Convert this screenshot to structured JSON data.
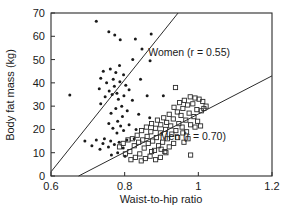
{
  "chart_data": {
    "type": "scatter",
    "title": "",
    "xlabel": "Waist-to-hip ratio",
    "ylabel": "Body fat mass (kg)",
    "xlim": [
      0.6,
      1.2
    ],
    "ylim": [
      0,
      70
    ],
    "xticks": [
      0.6,
      0.8,
      1,
      1.2
    ],
    "xtick_labels": [
      "0.6",
      "0.8",
      "1",
      "1.2"
    ],
    "yticks": [
      0,
      10,
      20,
      30,
      40,
      50,
      60,
      70
    ],
    "ytick_labels": [
      "0",
      "10",
      "20",
      "30",
      "40",
      "50",
      "60",
      "70"
    ],
    "grid": false,
    "legend_position": "inline-annotations",
    "series": [
      {
        "name": "Women",
        "marker": "filled-circle",
        "annotation": "Women (r = 0.55)",
        "r": 0.55,
        "annotation_x": 0.975,
        "annotation_y": 51.5,
        "fit_line": {
          "x": [
            0.6,
            0.945
          ],
          "y": [
            1.8,
            70.0
          ]
        },
        "points": [
          [
            0.651,
            34.8
          ],
          [
            0.723,
            66.5
          ],
          [
            0.757,
            62.0
          ],
          [
            0.773,
            60.5
          ],
          [
            0.788,
            58.5
          ],
          [
            0.829,
            58.8
          ],
          [
            0.872,
            61.0
          ],
          [
            0.847,
            54.5
          ],
          [
            0.822,
            50.0
          ],
          [
            0.869,
            49.5
          ],
          [
            0.786,
            47.5
          ],
          [
            0.761,
            46.0
          ],
          [
            0.742,
            45.0
          ],
          [
            0.776,
            44.5
          ],
          [
            0.797,
            43.5
          ],
          [
            0.735,
            42.0
          ],
          [
            0.769,
            41.5
          ],
          [
            0.787,
            40.5
          ],
          [
            0.751,
            40.0
          ],
          [
            0.803,
            39.0
          ],
          [
            0.772,
            38.5
          ],
          [
            0.731,
            37.5
          ],
          [
            0.812,
            37.0
          ],
          [
            0.843,
            41.5
          ],
          [
            0.758,
            36.5
          ],
          [
            0.779,
            35.5
          ],
          [
            0.766,
            35.0
          ],
          [
            0.798,
            34.5
          ],
          [
            0.861,
            34.5
          ],
          [
            0.905,
            34.5
          ],
          [
            0.747,
            34.0
          ],
          [
            0.783,
            33.0
          ],
          [
            0.821,
            32.5
          ],
          [
            0.735,
            31.0
          ],
          [
            0.792,
            30.0
          ],
          [
            0.776,
            29.0
          ],
          [
            0.807,
            28.0
          ],
          [
            0.763,
            27.0
          ],
          [
            0.838,
            26.5
          ],
          [
            0.794,
            25.5
          ],
          [
            0.868,
            25.0
          ],
          [
            0.781,
            23.5
          ],
          [
            0.757,
            22.5
          ],
          [
            0.812,
            22.0
          ],
          [
            0.789,
            21.5
          ],
          [
            0.768,
            20.5
          ],
          [
            0.831,
            20.0
          ],
          [
            0.797,
            19.5
          ],
          [
            0.779,
            18.5
          ],
          [
            0.745,
            16.0
          ],
          [
            0.723,
            15.5
          ],
          [
            0.692,
            15.0
          ],
          [
            0.762,
            15.0
          ],
          [
            0.806,
            15.5
          ],
          [
            0.826,
            16.0
          ],
          [
            0.785,
            14.5
          ],
          [
            0.741,
            14.0
          ],
          [
            0.772,
            13.5
          ],
          [
            0.711,
            13.0
          ],
          [
            0.756,
            12.5
          ],
          [
            0.796,
            12.0
          ],
          [
            0.733,
            11.5
          ],
          [
            0.781,
            10.0
          ],
          [
            0.764,
            9.0
          ],
          [
            0.801,
            8.5
          ]
        ]
      },
      {
        "name": "Men",
        "marker": "open-square",
        "annotation": "Men (r = 0.70)",
        "r": 0.7,
        "annotation_x": 0.985,
        "annotation_y": 15.5,
        "fit_line": {
          "x": [
            0.675,
            1.2
          ],
          "y": [
            0.0,
            43.0
          ]
        },
        "points": [
          [
            0.938,
            38.0
          ],
          [
            0.978,
            34.0
          ],
          [
            0.991,
            33.5
          ],
          [
            1.002,
            33.0
          ],
          [
            0.962,
            32.5
          ],
          [
            1.012,
            32.0
          ],
          [
            0.949,
            31.5
          ],
          [
            0.985,
            31.0
          ],
          [
            0.971,
            30.5
          ],
          [
            1.021,
            30.0
          ],
          [
            0.934,
            29.5
          ],
          [
            0.958,
            29.0
          ],
          [
            0.996,
            28.5
          ],
          [
            1.008,
            28.0
          ],
          [
            0.943,
            27.5
          ],
          [
            0.975,
            27.0
          ],
          [
            0.921,
            26.5
          ],
          [
            0.953,
            26.0
          ],
          [
            0.988,
            25.5
          ],
          [
            1.015,
            29.0
          ],
          [
            0.906,
            25.0
          ],
          [
            0.932,
            24.5
          ],
          [
            0.966,
            24.0
          ],
          [
            0.998,
            23.5
          ],
          [
            0.889,
            24.0
          ],
          [
            0.914,
            23.0
          ],
          [
            0.947,
            22.5
          ],
          [
            0.979,
            22.0
          ],
          [
            1.006,
            21.5
          ],
          [
            0.873,
            22.5
          ],
          [
            0.898,
            22.0
          ],
          [
            0.925,
            21.5
          ],
          [
            0.956,
            21.0
          ],
          [
            0.991,
            21.0
          ],
          [
            0.859,
            21.0
          ],
          [
            0.884,
            20.5
          ],
          [
            0.911,
            20.0
          ],
          [
            0.939,
            19.5
          ],
          [
            0.968,
            19.0
          ],
          [
            0.846,
            19.5
          ],
          [
            0.871,
            19.0
          ],
          [
            0.897,
            18.5
          ],
          [
            0.928,
            18.0
          ],
          [
            0.958,
            18.5
          ],
          [
            0.834,
            17.5
          ],
          [
            0.861,
            17.0
          ],
          [
            0.886,
            16.5
          ],
          [
            0.916,
            16.0
          ],
          [
            0.944,
            16.5
          ],
          [
            0.972,
            16.0
          ],
          [
            0.821,
            16.0
          ],
          [
            0.849,
            15.5
          ],
          [
            0.876,
            15.0
          ],
          [
            0.903,
            14.5
          ],
          [
            0.933,
            14.0
          ],
          [
            0.961,
            14.5
          ],
          [
            0.809,
            15.5
          ],
          [
            0.838,
            14.5
          ],
          [
            0.864,
            14.0
          ],
          [
            0.892,
            13.0
          ],
          [
            0.921,
            12.5
          ],
          [
            0.796,
            14.0
          ],
          [
            0.826,
            13.0
          ],
          [
            0.853,
            12.0
          ],
          [
            0.881,
            11.0
          ],
          [
            0.909,
            10.5
          ],
          [
            0.786,
            12.5
          ],
          [
            0.814,
            10.5
          ],
          [
            0.841,
            9.5
          ],
          [
            0.869,
            8.5
          ],
          [
            0.897,
            8.0
          ],
          [
            0.802,
            9.5
          ],
          [
            0.829,
            8.0
          ],
          [
            0.856,
            7.5
          ],
          [
            0.884,
            7.0
          ],
          [
            0.912,
            10.0
          ],
          [
            0.817,
            7.0
          ],
          [
            0.845,
            6.5
          ],
          [
            0.873,
            10.5
          ],
          [
            0.979,
            9.0
          ],
          [
            0.899,
            11.5
          ]
        ]
      }
    ]
  },
  "axes": {
    "x_label": "Waist-to-hip ratio",
    "y_label": "Body fat mass (kg)"
  }
}
